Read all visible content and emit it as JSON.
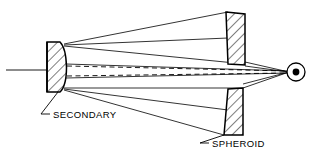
{
  "diagram": {
    "background_color": "#ffffff",
    "line_color": "#000000",
    "hatch_color": "#000000",
    "width": 316,
    "height": 156,
    "labels": {
      "secondary": "SECONDARY",
      "spheroid": "SPHEROID"
    },
    "components": {
      "secondary_mirror": {
        "name": "secondary",
        "x": 47,
        "y": 42,
        "width": 17,
        "height": 50,
        "face": "convex-right",
        "hatched": true
      },
      "spheroid_upper": {
        "name": "spheroid-upper-segment",
        "x": 225,
        "y": 12,
        "width": 20,
        "height": 53,
        "hatched": true
      },
      "spheroid_lower": {
        "name": "spheroid-lower-segment",
        "x": 222,
        "y": 88,
        "width": 20,
        "height": 47,
        "hatched": true
      },
      "focus_point": {
        "name": "focal-point",
        "cx": 296,
        "cy": 72,
        "outer_radius": 9,
        "inner_radius": 3.5
      },
      "optical_axis": {
        "name": "optical-axis",
        "x1": 8,
        "y1": 70,
        "x2": 64,
        "y2": 70
      }
    },
    "rays": {
      "solid_count": 6,
      "dashed_count": 2,
      "description": "Solid marginal rays from secondary edges to spheroid segments and converging at focus; dashed virtual rays through the axis region."
    }
  }
}
